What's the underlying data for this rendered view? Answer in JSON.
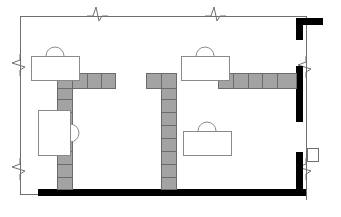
{
  "drawing": {
    "title": "Architectural Floor Plan Fragment",
    "type": "partial-floor-plan",
    "canvas": {
      "width": 341,
      "height": 217
    },
    "colors": {
      "background": "#ffffff",
      "thin_line": "#6f6f6f",
      "masonry_fill": "#a3a3a3",
      "masonry_stroke": "#6b6b6b",
      "solid_wall": "#000000",
      "furniture_stroke": "#8a8a8a"
    },
    "line_weights": {
      "thin_boundary": 1,
      "furniture": 1,
      "masonry_joint": 1,
      "solid_wall_thickness": 7
    }
  },
  "boundary": {
    "label": "match-line boundary",
    "top_line": {
      "x1": 20,
      "y1": 16,
      "x2": 306,
      "y2": 16
    },
    "left_line": {
      "x1": 20,
      "y1": 16,
      "x2": 20,
      "y2": 194
    },
    "right_line": {
      "x1": 306,
      "y1": 16,
      "x2": 306,
      "y2": 200
    },
    "bottom_line": {
      "x1": 20,
      "y1": 194,
      "x2": 38,
      "y2": 194
    },
    "break_symbols": [
      {
        "name": "break-top-left",
        "orientation": "horizontal",
        "x": 96,
        "y": 16
      },
      {
        "name": "break-top-right",
        "orientation": "horizontal",
        "x": 214,
        "y": 16
      },
      {
        "name": "break-left-upper",
        "orientation": "vertical",
        "x": 20,
        "y": 64
      },
      {
        "name": "break-left-lower",
        "orientation": "vertical",
        "x": 20,
        "y": 168
      },
      {
        "name": "break-right-upper",
        "orientation": "vertical",
        "x": 306,
        "y": 66
      },
      {
        "name": "break-right-lower",
        "orientation": "vertical",
        "x": 306,
        "y": 168
      }
    ]
  },
  "solid_walls": [
    {
      "name": "wall-bottom-slab",
      "orientation": "horizontal",
      "x": 38,
      "y": 189,
      "length": 268,
      "thickness": 7
    },
    {
      "name": "wall-right-upper-jamb",
      "orientation": "vertical",
      "x": 296,
      "y": 18,
      "length": 22,
      "thickness": 7
    },
    {
      "name": "wall-top-right-return",
      "orientation": "horizontal",
      "x": 296,
      "y": 18,
      "length": 27,
      "thickness": 7
    },
    {
      "name": "wall-right-middle-pier",
      "orientation": "vertical",
      "x": 296,
      "y": 66,
      "length": 56,
      "thickness": 7
    },
    {
      "name": "wall-right-lower-pier",
      "orientation": "vertical",
      "x": 296,
      "y": 152,
      "length": 40,
      "thickness": 7
    }
  ],
  "masonry_walls": [
    {
      "name": "masonry-wall-left-vertical",
      "orientation": "vertical",
      "x": 57,
      "y": 73,
      "width": 15,
      "height": 116,
      "courses": [
        73,
        86,
        99,
        112,
        125,
        138,
        151,
        164,
        177,
        189
      ]
    },
    {
      "name": "masonry-wall-left-horizontal",
      "orientation": "horizontal",
      "x": 57,
      "y": 73,
      "width": 58,
      "height": 15,
      "courses": [
        57,
        72,
        87,
        101,
        115
      ]
    },
    {
      "name": "masonry-wall-center-vertical",
      "orientation": "vertical",
      "x": 161,
      "y": 73,
      "width": 15,
      "height": 116,
      "courses": [
        73,
        86,
        99,
        112,
        125,
        138,
        151,
        164,
        177,
        189
      ]
    },
    {
      "name": "masonry-wall-center-left-stub",
      "orientation": "horizontal",
      "x": 146,
      "y": 73,
      "width": 30,
      "height": 15,
      "courses": [
        146,
        161,
        176
      ]
    },
    {
      "name": "masonry-wall-center-right-run",
      "orientation": "horizontal",
      "x": 218,
      "y": 73,
      "width": 78,
      "height": 15,
      "courses": [
        218,
        233,
        248,
        262,
        277,
        296
      ]
    }
  ],
  "furniture": [
    {
      "name": "desk-upper-left",
      "type": "desk-with-chair",
      "desk": {
        "x": 31,
        "y": 56,
        "width": 48,
        "height": 24
      },
      "chair": {
        "cx": 55,
        "cy": 56,
        "rx": 9,
        "ry": 9,
        "facing": "down"
      }
    },
    {
      "name": "desk-upper-center",
      "type": "desk-with-chair",
      "desk": {
        "x": 181,
        "y": 56,
        "width": 48,
        "height": 24
      },
      "chair": {
        "cx": 205,
        "cy": 56,
        "rx": 9,
        "ry": 9,
        "facing": "down"
      }
    },
    {
      "name": "desk-lower-center",
      "type": "desk-with-chair",
      "desk": {
        "x": 183,
        "y": 131,
        "width": 48,
        "height": 24
      },
      "chair": {
        "cx": 207,
        "cy": 131,
        "rx": 9,
        "ry": 9,
        "facing": "down"
      }
    },
    {
      "name": "desk-left-side",
      "type": "desk-with-chair-rotated",
      "desk": {
        "x": 38,
        "y": 110,
        "width": 32,
        "height": 45
      },
      "chair": {
        "cx": 70,
        "cy": 133,
        "rx": 9,
        "ry": 9,
        "facing": "right"
      }
    }
  ],
  "fixtures": [
    {
      "name": "column-right-small",
      "type": "small-rectangle",
      "x": 307,
      "y": 148,
      "width": 11,
      "height": 13
    }
  ]
}
